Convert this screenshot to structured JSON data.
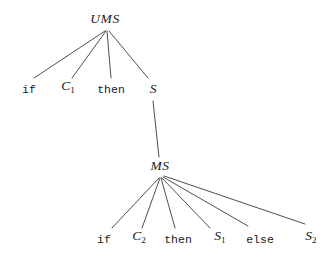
{
  "figure": {
    "kind": "parse-tree",
    "title": "",
    "background_color": "#ffffff",
    "edge_color": "#3a3a3a",
    "text_color": "#1b1b1b",
    "width": 335,
    "height": 258
  },
  "nodes": {
    "root": {
      "label": "UMS",
      "kind": "nonterminal",
      "x": 105,
      "y": 25
    },
    "l1_if": {
      "label": "if",
      "kind": "keyword",
      "x": 29,
      "y": 95
    },
    "l1_c1_base": {
      "label": "C",
      "sub": "1",
      "kind": "variable",
      "x": 68,
      "y": 95
    },
    "l1_then": {
      "label": "then",
      "kind": "keyword",
      "x": 111,
      "y": 95
    },
    "l1_s": {
      "label": "S",
      "kind": "variable",
      "x": 153,
      "y": 95
    },
    "mid": {
      "label": "MS",
      "kind": "nonterminal",
      "x": 160,
      "y": 172
    },
    "l2_if": {
      "label": "if",
      "kind": "keyword",
      "x": 104,
      "y": 245
    },
    "l2_c2_base": {
      "label": "C",
      "sub": "2",
      "kind": "variable",
      "x": 139,
      "y": 245
    },
    "l2_then": {
      "label": "then",
      "kind": "keyword",
      "x": 178,
      "y": 245
    },
    "l2_s1_base": {
      "label": "S",
      "sub": "1",
      "kind": "variable",
      "x": 220,
      "y": 245
    },
    "l2_else": {
      "label": "else",
      "kind": "keyword",
      "x": 260,
      "y": 245
    },
    "l2_s2_base": {
      "label": "S",
      "sub": "2",
      "kind": "variable",
      "x": 311,
      "y": 245
    }
  },
  "edges": [
    {
      "from": "UMS",
      "to": "if",
      "x1": 105,
      "y1": 31,
      "x2": 34,
      "y2": 78
    },
    {
      "from": "UMS",
      "to": "C1",
      "x1": 106,
      "y1": 31,
      "x2": 72,
      "y2": 78
    },
    {
      "from": "UMS",
      "to": "then",
      "x1": 107,
      "y1": 31,
      "x2": 111,
      "y2": 78
    },
    {
      "from": "UMS",
      "to": "S",
      "x1": 109,
      "y1": 31,
      "x2": 148,
      "y2": 78
    },
    {
      "from": "S",
      "to": "MS",
      "x1": 153,
      "y1": 101,
      "x2": 159,
      "y2": 157
    },
    {
      "from": "MS",
      "to": "if",
      "x1": 159,
      "y1": 178,
      "x2": 112,
      "y2": 228
    },
    {
      "from": "MS",
      "to": "C2",
      "x1": 160,
      "y1": 178,
      "x2": 142,
      "y2": 228
    },
    {
      "from": "MS",
      "to": "then",
      "x1": 161,
      "y1": 178,
      "x2": 175,
      "y2": 228
    },
    {
      "from": "MS",
      "to": "S1",
      "x1": 162,
      "y1": 178,
      "x2": 210,
      "y2": 228
    },
    {
      "from": "MS",
      "to": "else",
      "x1": 163,
      "y1": 177,
      "x2": 248,
      "y2": 226
    },
    {
      "from": "MS",
      "to": "S2",
      "x1": 164,
      "y1": 176,
      "x2": 305,
      "y2": 224
    }
  ],
  "grammar": {
    "production_1": "UMS -> if C1 then S",
    "production_2": "S -> MS",
    "production_3": "MS -> if C2 then S1 else S2"
  }
}
